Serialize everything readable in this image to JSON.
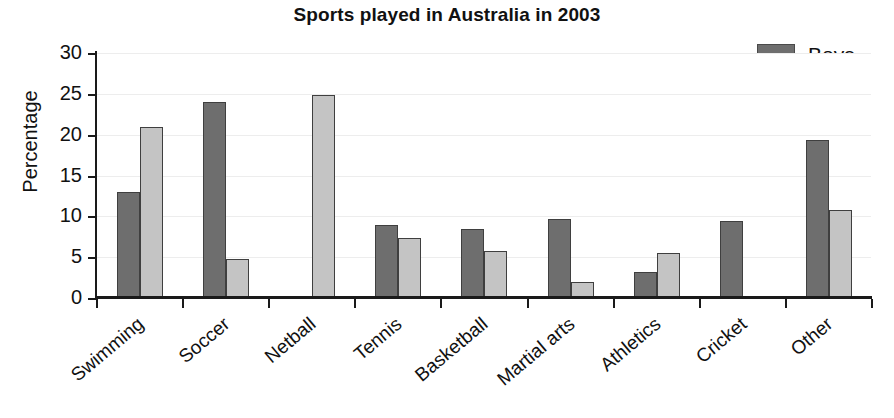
{
  "chart_data": {
    "type": "bar",
    "title": "Sports played in Australia in 2003",
    "xlabel": "",
    "ylabel": "Percentage",
    "ylim": [
      0,
      30
    ],
    "yticks": [
      0,
      5,
      10,
      15,
      20,
      25,
      30
    ],
    "ytick_labels": [
      "0",
      "5",
      "10",
      "15",
      "20",
      "25",
      "30"
    ],
    "grid": true,
    "legend_position": "top-right",
    "categories": [
      "Swimming",
      "Soccer",
      "Netball",
      "Tennis",
      "Basketball",
      "Martial arts",
      "Athletics",
      "Cricket",
      "Other"
    ],
    "series": [
      {
        "name": "Boys",
        "color": "#6e6e6e",
        "values": [
          13.0,
          24.0,
          0.3,
          9.0,
          8.5,
          9.7,
          3.2,
          9.4,
          19.3
        ]
      },
      {
        "name": "Girls",
        "color": "#c4c4c4",
        "values": [
          21.0,
          4.8,
          24.8,
          7.4,
          5.7,
          2.0,
          5.5,
          0.2,
          10.8
        ]
      }
    ]
  },
  "legend": {
    "items": [
      {
        "label": "Boys",
        "swatch": "boys"
      },
      {
        "label": "Girls",
        "swatch": "girls"
      }
    ]
  },
  "colors": {
    "boys": "#6e6e6e",
    "girls": "#c4c4c4",
    "axis": "#1a1a1a",
    "grid": "#ededed",
    "text": "#111111",
    "background": "#ffffff"
  }
}
